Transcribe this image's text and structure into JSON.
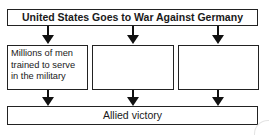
{
  "diagram": {
    "type": "cause-effect flowchart",
    "title": "United States Goes to War Against Germany",
    "effects": [
      {
        "text": "Millions of men trained to serve in the military"
      },
      {
        "text": ""
      },
      {
        "text": ""
      }
    ],
    "result": "Allied victory",
    "colors": {
      "border": "#222222",
      "arrow": "#111111",
      "background": "#ffffff",
      "text": "#1a1a1a"
    }
  }
}
